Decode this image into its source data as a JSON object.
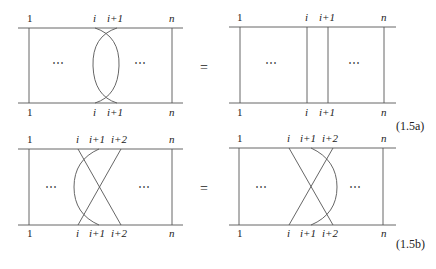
{
  "equations": [
    {
      "tag": "(1.5a)",
      "equals": "=",
      "left": {
        "top_labels": [
          "1",
          "i",
          "i+1",
          "n"
        ],
        "bottom_labels": [
          "1",
          "i",
          "i+1",
          "n"
        ],
        "ellipsis_left": "⋯",
        "ellipsis_right": "⋯",
        "description": "strands i and i+1 cross twice (double crossing)"
      },
      "right": {
        "top_labels": [
          "1",
          "i",
          "i+1",
          "n"
        ],
        "bottom_labels": [
          "1",
          "i",
          "i+1",
          "n"
        ],
        "ellipsis_left": "⋯",
        "ellipsis_right": "⋯",
        "description": "identity: all strands vertical"
      }
    },
    {
      "tag": "(1.5b)",
      "equals": "=",
      "left": {
        "top_labels": [
          "1",
          "i",
          "i+1",
          "i+2",
          "n"
        ],
        "bottom_labels": [
          "1",
          "i",
          "i+1",
          "i+2",
          "n"
        ],
        "ellipsis_left": "⋯",
        "ellipsis_right": "⋯",
        "description": "strands i and i+2 cross, strand i+1 arcs to the left"
      },
      "right": {
        "top_labels": [
          "1",
          "i",
          "i+1",
          "i+2",
          "n"
        ],
        "bottom_labels": [
          "1",
          "i",
          "i+1",
          "i+2",
          "n"
        ],
        "ellipsis_left": "⋯",
        "ellipsis_right": "⋯",
        "description": "strands i and i+2 cross, strand i+1 arcs to the right"
      }
    }
  ]
}
